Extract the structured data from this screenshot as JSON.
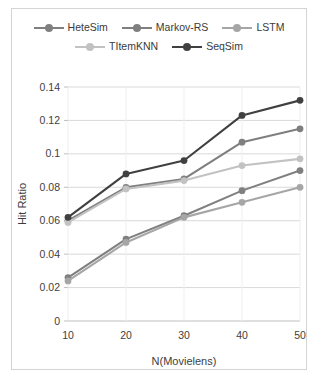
{
  "chart_data": {
    "type": "line",
    "title": "",
    "xlabel": "N(Movielens)",
    "ylabel": "Hit Ratio",
    "x": [
      10,
      20,
      30,
      40,
      50
    ],
    "categories": [
      "10",
      "20",
      "30",
      "40",
      "50"
    ],
    "xtick_labels": [
      "10",
      "20",
      "30",
      "40",
      "50"
    ],
    "ytick_labels": [
      "0",
      "0.02",
      "0.04",
      "0.06",
      "0.08",
      "0.1",
      "0.12",
      "0.14"
    ],
    "ytick_values": [
      0,
      0.02,
      0.04,
      0.06,
      0.08,
      0.1,
      0.12,
      0.14
    ],
    "ylim": [
      0,
      0.14
    ],
    "xlim": [
      10,
      50
    ],
    "grid": "horizontal",
    "legend_position": "top",
    "series": [
      {
        "name": "HeteSim",
        "color": "#808080",
        "values": [
          0.026,
          0.049,
          0.063,
          0.078,
          0.09
        ]
      },
      {
        "name": "Markov-RS",
        "color": "#7f7f7f",
        "values": [
          0.06,
          0.08,
          0.085,
          0.107,
          0.115
        ]
      },
      {
        "name": "LSTM",
        "color": "#a6a6a6",
        "values": [
          0.024,
          0.047,
          0.062,
          0.071,
          0.08
        ]
      },
      {
        "name": "TItemKNN",
        "color": "#c2c2c2",
        "values": [
          0.059,
          0.079,
          0.084,
          0.093,
          0.097
        ]
      },
      {
        "name": "SeqSim",
        "color": "#404040",
        "values": [
          0.062,
          0.088,
          0.096,
          0.123,
          0.132
        ]
      }
    ]
  },
  "legend": {
    "rows": [
      [
        "HeteSim",
        "Markov-RS",
        "LSTM"
      ],
      [
        "TItemKNN",
        "SeqSim"
      ]
    ]
  },
  "colors": {
    "grid": "#d9d9d9",
    "axis": "#bfbfbf",
    "text": "#3d3d3d",
    "border": "#d4d4d4",
    "background": "#ffffff"
  }
}
